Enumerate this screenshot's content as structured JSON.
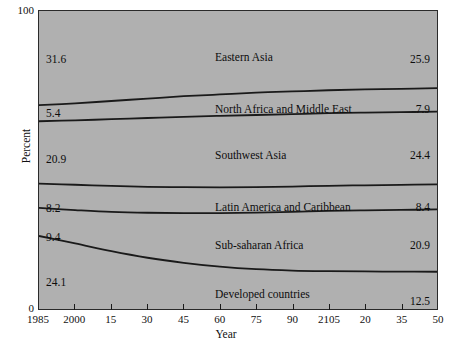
{
  "chart_data": {
    "type": "area",
    "title": "",
    "subtitle": "",
    "xlabel": "Year",
    "ylabel": "Percent",
    "ylim": [
      0,
      100
    ],
    "xlim": [
      1985,
      2150
    ],
    "grid": false,
    "legend": "inline-band-labels",
    "stacked": true,
    "normalized_to_100": true,
    "y_tick_labels": [
      "0",
      "100"
    ],
    "y_ticks": [
      0,
      100
    ],
    "x_tick_labels": [
      "1985",
      "2000",
      "15",
      "30",
      "45",
      "60",
      "75",
      "90",
      "2105",
      "20",
      "35",
      "50"
    ],
    "x_ticks": [
      1985,
      2000,
      2015,
      2030,
      2045,
      2060,
      2075,
      2090,
      2105,
      2120,
      2135,
      2150
    ],
    "series": [
      {
        "name": "Eastern Asia",
        "start_value": 31.6,
        "end_value": 25.9,
        "start_label": "31.6",
        "end_label": "25.9",
        "label_x_pct": 48,
        "values": [
          31.6,
          31.0,
          30.2,
          29.4,
          28.6,
          28.0,
          27.4,
          27.0,
          26.6,
          26.3,
          26.1,
          25.9
        ]
      },
      {
        "name": "North Africa and Middle East",
        "start_value": 5.4,
        "end_value": 7.9,
        "start_label": "5.4",
        "end_label": "7.9",
        "label_x_pct": 48,
        "values": [
          5.4,
          5.7,
          6.1,
          6.5,
          6.9,
          7.2,
          7.5,
          7.6,
          7.7,
          7.8,
          7.85,
          7.9
        ]
      },
      {
        "name": "Southwest Asia",
        "start_value": 20.9,
        "end_value": 24.4,
        "start_label": "20.9",
        "end_label": "24.4",
        "label_x_pct": 48,
        "values": [
          20.9,
          21.6,
          22.4,
          23.1,
          23.6,
          24.0,
          24.2,
          24.3,
          24.35,
          24.4,
          24.4,
          24.4
        ]
      },
      {
        "name": "Latin America and Caribbean",
        "start_value": 8.2,
        "end_value": 8.4,
        "start_label": "8.2",
        "end_label": "8.4",
        "label_x_pct": 48,
        "values": [
          8.2,
          8.5,
          8.7,
          8.7,
          8.7,
          8.6,
          8.55,
          8.5,
          8.45,
          8.4,
          8.4,
          8.4
        ]
      },
      {
        "name": "Sub-saharan Africa",
        "start_value": 9.4,
        "end_value": 20.9,
        "start_label": "9.4",
        "end_label": "20.9",
        "label_x_pct": 48,
        "values": [
          9.4,
          11.2,
          13.2,
          15.1,
          16.7,
          18.0,
          19.0,
          19.7,
          20.2,
          20.5,
          20.7,
          20.9
        ]
      },
      {
        "name": "Developed countries",
        "start_value": 24.1,
        "end_value": 12.5,
        "start_label": "24.1",
        "end_label": "12.5",
        "label_x_pct": 48,
        "values": [
          24.1,
          21.0,
          18.4,
          16.4,
          14.9,
          13.8,
          13.1,
          12.8,
          12.6,
          12.5,
          12.5,
          12.5
        ]
      }
    ],
    "colors": {
      "plot_background": "#b0b0b0",
      "page_background": "#ffffff",
      "line": "#1a1a1a",
      "text": "#0d0d0d",
      "axis": "#2a2a2a"
    }
  }
}
